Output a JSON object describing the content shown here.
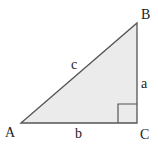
{
  "diagram": {
    "vertices": [
      {
        "id": "A",
        "label": "A"
      },
      {
        "id": "B",
        "label": "B"
      },
      {
        "id": "C",
        "label": "C"
      }
    ],
    "sides": [
      {
        "id": "a",
        "label": "a",
        "between": [
          "B",
          "C"
        ]
      },
      {
        "id": "b",
        "label": "b",
        "between": [
          "A",
          "C"
        ]
      },
      {
        "id": "c",
        "label": "c",
        "between": [
          "A",
          "B"
        ]
      }
    ],
    "right_angle_at": "C",
    "colors": {
      "fill": "#ebebeb",
      "stroke": "#555555",
      "text": "#222222"
    }
  }
}
